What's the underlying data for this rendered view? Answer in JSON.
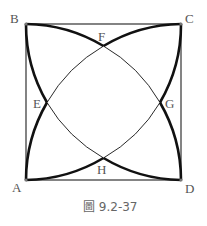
{
  "figure": {
    "caption": "圖 9.2-37",
    "points": {
      "A": "A",
      "B": "B",
      "C": "C",
      "D": "D",
      "E": "E",
      "F": "F",
      "G": "G",
      "H": "H"
    },
    "colors": {
      "stroke": "#111111",
      "square": "#333333",
      "label": "#555555"
    }
  }
}
